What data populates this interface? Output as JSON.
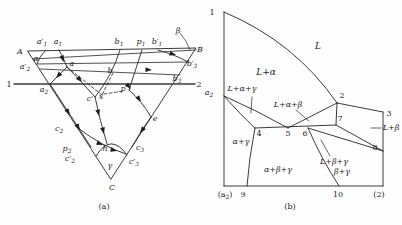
{
  "figure": {
    "colors": {
      "line": "#262626",
      "background": "#fefefe",
      "emphasis_line": "#3b3b3b"
    },
    "panel_a": {
      "caption": "(a)",
      "labels": [
        {
          "id": "vertex-A",
          "b": "A",
          "x": 20,
          "y": 54,
          "it": 1
        },
        {
          "id": "a-prime-1",
          "b": "a′",
          "s": "1",
          "x": 42,
          "y": 44,
          "it": 1
        },
        {
          "id": "a-1",
          "b": "a",
          "s": "1",
          "x": 58,
          "y": 44,
          "it": 1
        },
        {
          "id": "b-1",
          "b": "b",
          "s": "1",
          "x": 119,
          "y": 44,
          "it": 1
        },
        {
          "id": "p-1",
          "b": "p",
          "s": "1",
          "x": 141,
          "y": 44,
          "it": 1
        },
        {
          "id": "b-prime-1",
          "b": "b′",
          "s": "1",
          "x": 157,
          "y": 44,
          "it": 1
        },
        {
          "id": "beta",
          "b": "β",
          "x": 178,
          "y": 33,
          "it": 1
        },
        {
          "id": "vertex-B",
          "b": "B",
          "x": 200,
          "y": 52,
          "it": 1
        },
        {
          "id": "alpha",
          "b": "α",
          "x": 36,
          "y": 61,
          "it": 1
        },
        {
          "id": "a-prime-2",
          "b": "a′",
          "s": "2",
          "x": 25,
          "y": 69,
          "it": 1
        },
        {
          "id": "point-a",
          "b": "a",
          "x": 72,
          "y": 66,
          "it": 1
        },
        {
          "id": "b-prime-3",
          "b": "b′",
          "s": "3",
          "x": 192,
          "y": 66,
          "it": 1
        },
        {
          "id": "point-b",
          "b": "b",
          "x": 110,
          "y": 73,
          "it": 1
        },
        {
          "id": "b-3",
          "b": "b",
          "s": "3",
          "x": 177,
          "y": 81,
          "it": 1
        },
        {
          "id": "line-end-1",
          "b": "1",
          "x": 9,
          "y": 87
        },
        {
          "id": "line-end-2",
          "b": "2",
          "x": 199,
          "y": 87
        },
        {
          "id": "a-2",
          "b": "a",
          "s": "2",
          "x": 44,
          "y": 92,
          "it": 1
        },
        {
          "id": "c-prime",
          "b": "c′",
          "x": 90,
          "y": 101,
          "it": 1
        },
        {
          "id": "point-x",
          "b": "x",
          "x": 101,
          "y": 99,
          "it": 1
        },
        {
          "id": "point-p",
          "b": "p",
          "x": 123,
          "y": 91,
          "it": 1
        },
        {
          "id": "point-e",
          "b": "e",
          "x": 155,
          "y": 121,
          "it": 1
        },
        {
          "id": "c-2",
          "b": "c",
          "s": "2",
          "x": 59,
          "y": 131,
          "it": 1
        },
        {
          "id": "c-3",
          "b": "c",
          "s": "3",
          "x": 140,
          "y": 150,
          "it": 1
        },
        {
          "id": "p-2",
          "b": "p",
          "s": "2",
          "x": 67,
          "y": 151,
          "it": 1
        },
        {
          "id": "point-h",
          "b": "h",
          "x": 105,
          "y": 151,
          "it": 1
        },
        {
          "id": "c-prime-2",
          "b": "c′",
          "s": "2",
          "x": 70,
          "y": 161,
          "it": 1
        },
        {
          "id": "c-prime-3",
          "b": "c′",
          "s": "3",
          "x": 134,
          "y": 164,
          "it": 1
        },
        {
          "id": "gamma",
          "b": "γ",
          "x": 110,
          "y": 168,
          "it": 1
        },
        {
          "id": "vertex-C",
          "b": "C",
          "x": 112,
          "y": 190,
          "it": 1
        },
        {
          "id": "caption-a",
          "b": "(a)",
          "x": 104,
          "y": 209
        }
      ],
      "arrows": [
        {
          "x": 64,
          "y": 62,
          "a": 68
        },
        {
          "x": 56,
          "y": 78,
          "a": 133
        },
        {
          "x": 82,
          "y": 82,
          "a": 47
        },
        {
          "x": 70,
          "y": 115,
          "a": 57
        },
        {
          "x": 80,
          "y": 130,
          "a": 57
        },
        {
          "x": 99,
          "y": 116,
          "a": 78
        },
        {
          "x": 104,
          "y": 134,
          "a": 76
        },
        {
          "x": 103,
          "y": 145,
          "a": 22
        },
        {
          "x": 117,
          "y": 151,
          "a": 15
        },
        {
          "x": 176,
          "y": 55,
          "a": 16
        },
        {
          "x": 152,
          "y": 70,
          "a": 3
        },
        {
          "x": 131,
          "y": 89,
          "a": 48
        },
        {
          "x": 141,
          "y": 102,
          "a": 55
        },
        {
          "x": 140,
          "y": 133,
          "a": 127
        }
      ]
    },
    "panel_b": {
      "caption": "(b)",
      "regions": [
        "L",
        "L+α",
        "L+α+γ",
        "L+α+β",
        "α+γ",
        "α+β+γ",
        "L+β",
        "L+β+γ",
        "β+γ"
      ],
      "labels": [
        {
          "id": "point-1",
          "b": "1",
          "x": 212,
          "y": 15
        },
        {
          "id": "point-a2",
          "b": "a",
          "s": "2",
          "x": 209,
          "y": 95,
          "it": 1
        },
        {
          "id": "region-L",
          "b": "L",
          "x": 318,
          "y": 49,
          "it": 1,
          "big": 1
        },
        {
          "id": "region-L-alpha",
          "b": "L+α",
          "x": 266,
          "y": 75,
          "it": 1,
          "big": 1
        },
        {
          "id": "region-L-alpha-gamma",
          "b": "L+α+γ",
          "x": 242,
          "y": 91,
          "it": 1
        },
        {
          "id": "region-L-alpha-beta",
          "b": "L+α+β",
          "x": 288,
          "y": 107,
          "it": 1
        },
        {
          "id": "point-2",
          "b": "2",
          "x": 342,
          "y": 98
        },
        {
          "id": "point-3",
          "b": "3",
          "x": 389,
          "y": 116
        },
        {
          "id": "point-7",
          "b": "7",
          "x": 340,
          "y": 121
        },
        {
          "id": "region-L-beta",
          "b": "L+β",
          "x": 391,
          "y": 130,
          "it": 1
        },
        {
          "id": "point-8",
          "b": "8",
          "x": 375,
          "y": 150
        },
        {
          "id": "point-4",
          "b": "4",
          "x": 259,
          "y": 136
        },
        {
          "id": "point-5",
          "b": "5",
          "x": 288,
          "y": 136
        },
        {
          "id": "point-6",
          "b": "6",
          "x": 305,
          "y": 136
        },
        {
          "id": "region-alpha-gamma",
          "b": "α+γ",
          "x": 241,
          "y": 144,
          "it": 1
        },
        {
          "id": "region-alpha-beta-gamma",
          "b": "α+β+γ",
          "x": 278,
          "y": 172,
          "it": 1
        },
        {
          "id": "region-L-beta-gamma",
          "b": "L+β+γ",
          "x": 334,
          "y": 164,
          "it": 1
        },
        {
          "id": "region-beta-gamma",
          "b": "β+γ",
          "x": 342,
          "y": 174,
          "it": 1
        },
        {
          "id": "axis-a2",
          "b": "(a",
          "s": "2",
          "p": ")",
          "x": 225,
          "y": 197
        },
        {
          "id": "point-9",
          "b": "9",
          "x": 243,
          "y": 197
        },
        {
          "id": "point-10",
          "b": "10",
          "x": 338,
          "y": 197
        },
        {
          "id": "axis-2",
          "b": "(2)",
          "x": 379,
          "y": 197
        },
        {
          "id": "caption-b",
          "b": "(b)",
          "x": 290,
          "y": 209
        }
      ],
      "arrows": []
    }
  }
}
